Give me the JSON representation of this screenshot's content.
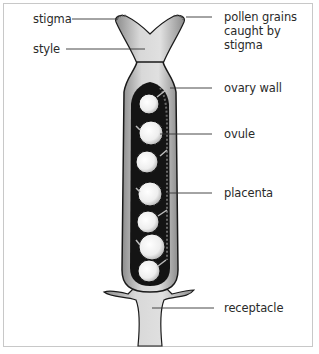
{
  "diagram": {
    "labels": {
      "stigma": "stigma",
      "pollen": "pollen grains\ncaught by stigma",
      "style": "style",
      "ovary_wall": "ovary wall",
      "ovule": "ovule",
      "placenta": "placenta",
      "receptacle": "receptacle"
    },
    "colors": {
      "frame": "#c8c8c8",
      "outline": "#1a1a1a",
      "tissue_light": "#d4d4d4",
      "tissue_mid": "#a8a8a8",
      "cavity": "#141414",
      "ovule": "#f2f2f2",
      "leader_line": "#333333"
    }
  }
}
